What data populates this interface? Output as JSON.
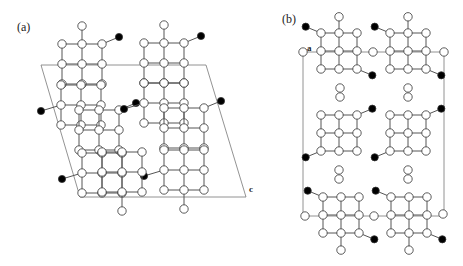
{
  "panels": [
    {
      "label": "(a)",
      "axis_label": "c"
    },
    {
      "label": "(b)",
      "axis_label": "a"
    }
  ],
  "colors": {
    "open_atom": "#ffffff",
    "filled_atom": "#000000",
    "bond": "#555555",
    "cell": "#777777"
  }
}
